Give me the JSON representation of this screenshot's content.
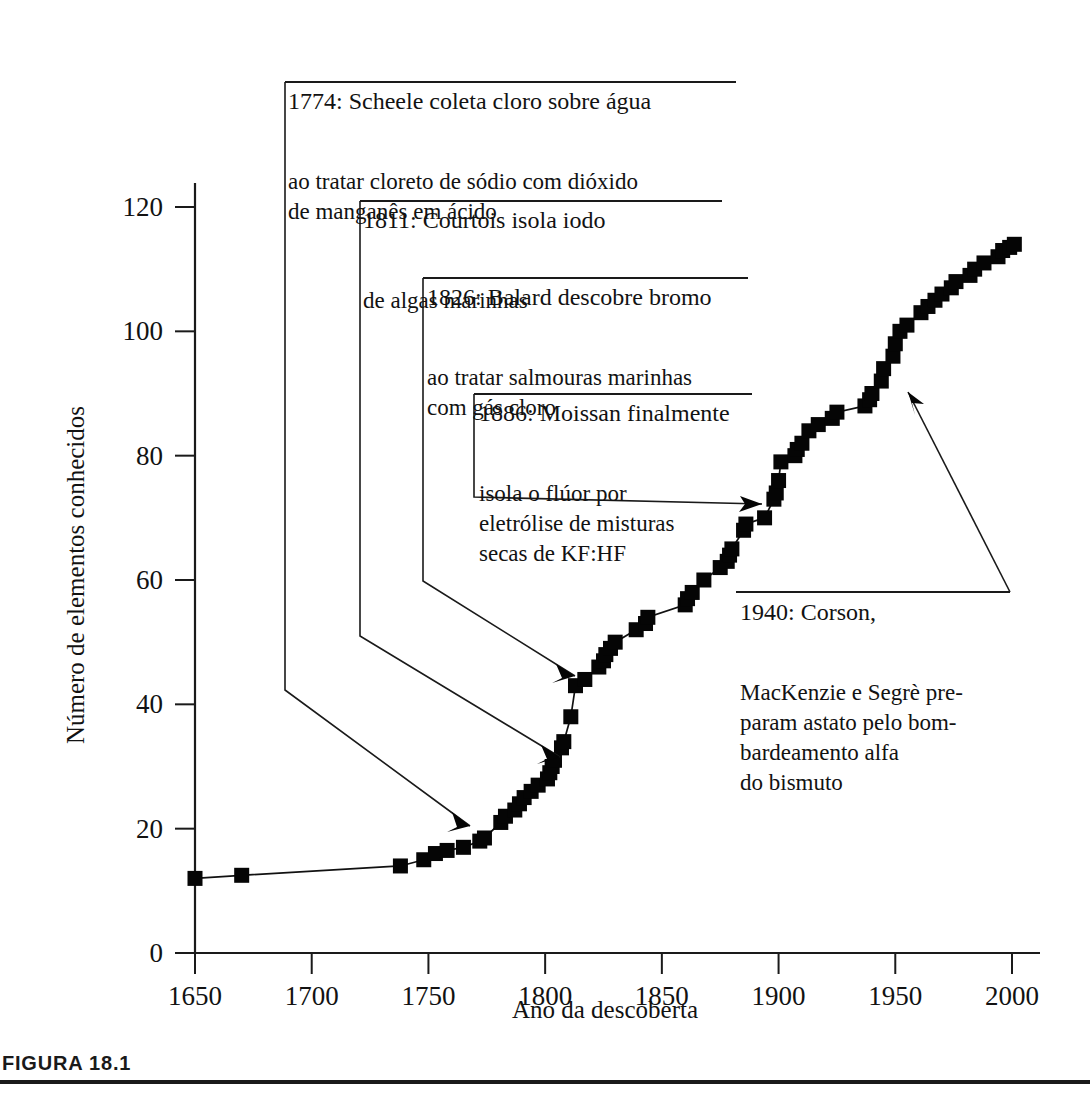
{
  "figure": {
    "caption_label": "FIGURA 18.1"
  },
  "chart_data": {
    "type": "line",
    "title": "",
    "xlabel": "Ano da descoberta",
    "ylabel": "Número de elementos conhecidos",
    "xlim": [
      1650,
      2010
    ],
    "ylim": [
      0,
      128
    ],
    "xticks": [
      1650,
      1700,
      1750,
      1800,
      1850,
      1900,
      1950,
      2000
    ],
    "xticklabels": [
      "1650",
      "1700",
      "1750",
      "1800",
      "1850",
      "1900",
      "1950",
      "2000"
    ],
    "yticks": [
      0,
      20,
      40,
      60,
      80,
      100,
      120
    ],
    "yticklabels": [
      "0",
      "20",
      "40",
      "60",
      "80",
      "100",
      "120"
    ],
    "grid": false,
    "legend": false,
    "marker": "square",
    "series": [
      {
        "name": "Número de elementos conhecidos",
        "x": [
          1650,
          1670,
          1738,
          1748,
          1753,
          1758,
          1765,
          1772,
          1774,
          1781,
          1783,
          1787,
          1789,
          1791,
          1794,
          1797,
          1801,
          1802,
          1803,
          1804,
          1807,
          1808,
          1811,
          1813,
          1817,
          1823,
          1825,
          1826,
          1828,
          1830,
          1839,
          1843,
          1844,
          1860,
          1861,
          1863,
          1868,
          1875,
          1878,
          1879,
          1880,
          1885,
          1886,
          1894,
          1898,
          1899,
          1900,
          1901,
          1907,
          1908,
          1910,
          1913,
          1917,
          1923,
          1925,
          1937,
          1939,
          1940,
          1944,
          1945,
          1949,
          1950,
          1952,
          1955,
          1961,
          1964,
          1967,
          1970,
          1974,
          1976,
          1982,
          1984,
          1988,
          1994,
          1996,
          1999,
          2001
        ],
        "y": [
          12,
          12.5,
          14,
          15,
          16,
          16.5,
          17,
          18,
          18.5,
          21,
          22,
          23,
          24,
          25,
          26,
          27,
          28,
          29,
          30,
          31,
          33,
          34,
          38,
          43,
          44,
          46,
          47,
          48,
          49,
          50,
          52,
          53,
          54,
          56,
          57,
          58,
          60,
          62,
          63,
          64,
          65,
          68,
          69,
          70,
          73,
          74,
          76,
          79,
          80,
          81,
          82,
          84,
          85,
          86,
          87,
          88,
          89,
          90,
          92,
          94,
          96,
          98,
          100,
          101,
          103,
          104,
          105,
          106,
          107,
          108,
          109,
          110,
          111,
          112,
          113,
          113.5,
          114
        ]
      }
    ],
    "annotations": [
      {
        "id": "scheele-1774",
        "head": "1774: Scheele coleta cloro sobre água",
        "body_lines": [
          "ao tratar cloreto de sódio com dióxido",
          "de manganês em ácido"
        ],
        "points_to_year": 1774,
        "points_to_value": 18.5
      },
      {
        "id": "courtois-1811",
        "head": "1811: Courtois isola iodo",
        "body_lines": [
          "de algas marinhas"
        ],
        "points_to_year": 1811,
        "points_to_value": 31
      },
      {
        "id": "balard-1826",
        "head": "1826: Balard descobre bromo",
        "body_lines": [
          "ao tratar salmouras marinhas",
          "com gás cloro"
        ],
        "points_to_year": 1826,
        "points_to_value": 43
      },
      {
        "id": "moissan-1886",
        "head": "1886: Moissan finalmente",
        "body_lines": [
          "isola o flúor por",
          "eletrólise de misturas",
          "secas de KF:HF"
        ],
        "points_to_year": 1898,
        "points_to_value": 73
      },
      {
        "id": "corson-1940",
        "head": "1940: Corson,",
        "body_lines": [
          "MacKenzie e Segrè pre-",
          "param astato pelo bom-",
          "bardeamento alfa",
          "do bismuto"
        ],
        "points_to_year": 1955,
        "points_to_value": 91
      }
    ]
  }
}
